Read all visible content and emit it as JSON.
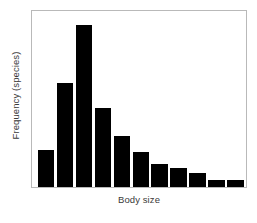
{
  "chart_data": {
    "type": "bar",
    "title": "",
    "subtitle": "",
    "xlabel": "Body size",
    "ylabel": "Frequency (species)",
    "categories": [
      "1",
      "2",
      "3",
      "4",
      "5",
      "6",
      "7",
      "8",
      "9",
      "10",
      "11"
    ],
    "values": [
      21,
      59,
      92,
      45,
      29,
      20,
      13,
      11,
      8,
      4,
      4
    ],
    "ylim": [
      0,
      100
    ],
    "xlim": [
      0,
      11
    ],
    "grid": false,
    "legend": null,
    "legend_position": "none",
    "xtick_labels": [],
    "ytick_labels": [],
    "annotations": [],
    "series": [
      {
        "name": "Frequency (species)",
        "values": [
          21,
          59,
          92,
          45,
          29,
          20,
          13,
          11,
          8,
          4,
          4
        ]
      }
    ],
    "bar_color": "#000000",
    "frame_color": "#b9b9b9",
    "background_color": "#ffffff",
    "text_color": "#3a3a3a"
  }
}
